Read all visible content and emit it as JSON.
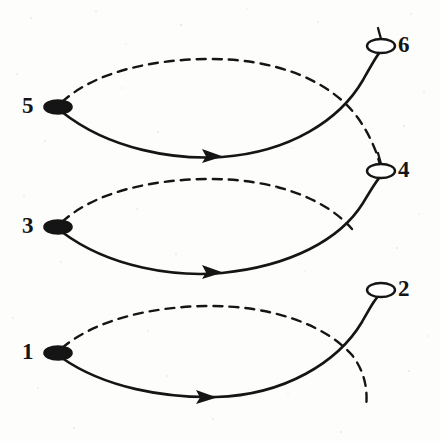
{
  "figure": {
    "background_color": "#fdfdfc",
    "stroke_color": "#151515",
    "width": 440,
    "height": 441
  },
  "nodes": [
    {
      "id": "6",
      "label": "6",
      "style": "open",
      "fill": "#ffffff",
      "cx": 381,
      "cy": 46,
      "rx": 14,
      "ry": 7,
      "label_x": 398,
      "label_y": 33
    },
    {
      "id": "4",
      "label": "4",
      "style": "open",
      "fill": "#ffffff",
      "cx": 381,
      "cy": 171,
      "rx": 14,
      "ry": 7,
      "label_x": 398,
      "label_y": 158
    },
    {
      "id": "2",
      "label": "2",
      "style": "open",
      "fill": "#ffffff",
      "cx": 381,
      "cy": 290,
      "rx": 14,
      "ry": 7,
      "label_x": 398,
      "label_y": 277
    },
    {
      "id": "5",
      "label": "5",
      "style": "filled",
      "fill": "#151515",
      "cx": 58,
      "cy": 107,
      "rx": 14,
      "ry": 7,
      "label_x": 22,
      "label_y": 94
    },
    {
      "id": "3",
      "label": "3",
      "style": "filled",
      "fill": "#151515",
      "cx": 58,
      "cy": 227,
      "rx": 14,
      "ry": 7,
      "label_x": 22,
      "label_y": 214
    },
    {
      "id": "1",
      "label": "1",
      "style": "filled",
      "fill": "#151515",
      "cx": 58,
      "cy": 353,
      "rx": 14,
      "ry": 7,
      "label_x": 22,
      "label_y": 340
    }
  ],
  "edges": [
    {
      "name": "solid-arc-5-to-6",
      "from": "5",
      "to": "6",
      "style": "solid",
      "arrow": true,
      "arrow_at": {
        "x": 213,
        "y": 156
      },
      "path": "M 62 112 C 110 150 175 160 222 157 C 290 152 340 120 363 80 C 372 64 377 55 380 52"
    },
    {
      "name": "dashed-arc-5-to-4",
      "from": "5",
      "to": "4",
      "style": "dashed",
      "arrow": false,
      "path": "M 62 102 C 95 72 150 60 205 59 C 275 58 330 80 358 118 C 372 138 378 156 380 165"
    },
    {
      "name": "solid-arc-3-to-4",
      "from": "3",
      "to": "4",
      "style": "solid",
      "arrow": true,
      "arrow_at": {
        "x": 213,
        "y": 272
      },
      "path": "M 62 232 C 110 268 175 277 222 273 C 290 266 340 240 363 203 C 372 188 377 180 380 177"
    },
    {
      "name": "dashed-arc-3-to-2",
      "from": "3",
      "to": "2",
      "style": "dashed",
      "arrow": false,
      "path": "M 62 222 C 95 192 150 180 205 179 C 272 178 325 198 352 229"
    },
    {
      "name": "solid-arc-1-to-2",
      "from": "1",
      "to": "2",
      "style": "solid",
      "arrow": true,
      "arrow_at": {
        "x": 207,
        "y": 397
      },
      "path": "M 62 358 C 105 388 165 398 216 397 C 285 395 338 362 362 322 C 371 306 377 295 380 296"
    },
    {
      "name": "dashed-arc-1-tail",
      "from": "1",
      "to": null,
      "style": "dashed",
      "arrow": false,
      "path": "M 62 348 C 95 320 150 307 205 306 C 272 305 325 325 352 355 C 365 372 368 390 366 408"
    }
  ],
  "node_ticks": [
    {
      "name": "tick-node-6",
      "path": "M 381 39 L 378 28"
    },
    {
      "name": "tick-node-4",
      "path": "M 381 164 L 378 153"
    }
  ]
}
